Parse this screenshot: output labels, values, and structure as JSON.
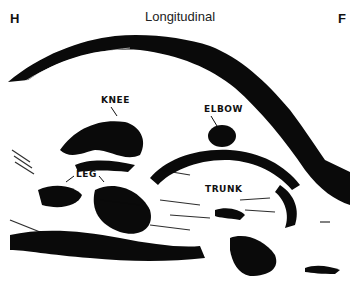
{
  "figure": {
    "title": "Longitudinal",
    "orientation_left": "H",
    "orientation_right": "F",
    "labels": {
      "knee": "KNEE",
      "elbow": "ELBOW",
      "leg": "LEG",
      "trunk": "TRUNK"
    },
    "colors": {
      "echo": "#0a0a0a",
      "background": "#ffffff"
    }
  }
}
